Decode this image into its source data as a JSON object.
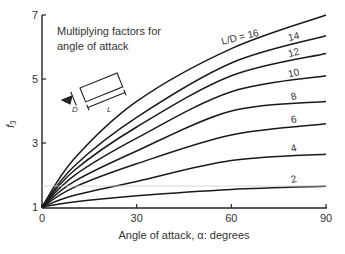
{
  "chart_data": {
    "type": "line",
    "title": "Multiplying factors for angle of attack",
    "title_lines": [
      "Multiplying factors for",
      "angle of attack"
    ],
    "xlabel": "Angle of attack, α: degrees",
    "ylabel": "f₃",
    "xlim": [
      0,
      90
    ],
    "ylim": [
      1,
      7
    ],
    "x_ticks": [
      0,
      30,
      60,
      90
    ],
    "y_ticks": [
      1,
      3,
      5,
      7
    ],
    "grid": false,
    "legend": "inline labels on curves",
    "x": [
      0,
      30,
      60,
      90
    ],
    "series": [
      {
        "name": "L/D = 16",
        "label": "L/D = 16",
        "values": [
          1.0,
          4.3,
          5.95,
          7.0
        ]
      },
      {
        "name": "L/D = 14",
        "label": "14",
        "values": [
          1.0,
          3.8,
          5.5,
          6.35
        ]
      },
      {
        "name": "L/D = 12",
        "label": "12",
        "values": [
          1.0,
          3.5,
          5.1,
          5.8
        ]
      },
      {
        "name": "L/D = 10",
        "label": "10",
        "values": [
          1.0,
          3.15,
          4.6,
          5.1
        ]
      },
      {
        "name": "L/D = 8",
        "label": "8",
        "values": [
          1.0,
          2.75,
          4.0,
          4.3
        ]
      },
      {
        "name": "L/D = 6",
        "label": "6",
        "values": [
          1.0,
          2.35,
          3.25,
          3.6
        ]
      },
      {
        "name": "L/D = 4",
        "label": "4",
        "values": [
          1.0,
          1.8,
          2.45,
          2.65
        ]
      },
      {
        "name": "L/D = 2",
        "label": "2",
        "values": [
          1.0,
          1.35,
          1.55,
          1.65
        ]
      }
    ],
    "inset_diagram": {
      "labels": [
        "α",
        "D",
        "L"
      ],
      "description": "rectangular body of length L and width D at angle α"
    }
  }
}
